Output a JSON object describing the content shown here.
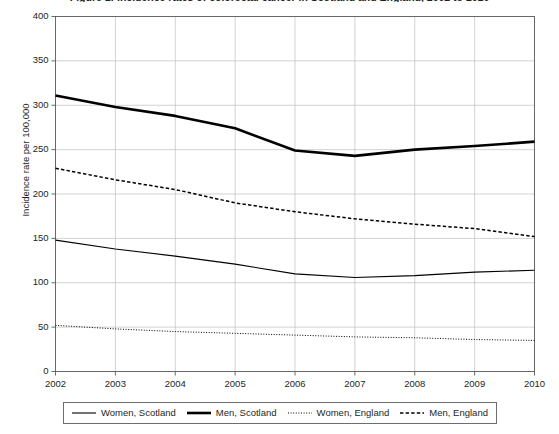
{
  "chart_data": {
    "type": "line",
    "title": "Figure 1: Incidence rates of colorectal cancer in Scotland and England, 2002 to 2010",
    "xlabel": "",
    "ylabel": "Incidence rate per 100,000",
    "x": [
      2002,
      2003,
      2004,
      2005,
      2006,
      2007,
      2008,
      2009,
      2010
    ],
    "xtick_labels": [
      "2002",
      "2003",
      "2004",
      "2005",
      "2006",
      "2007",
      "2008",
      "2009",
      "2010"
    ],
    "xlim": [
      2002,
      2010
    ],
    "ylim": [
      0,
      400
    ],
    "yticks": [
      0,
      50,
      100,
      150,
      200,
      250,
      300,
      350,
      400
    ],
    "ytick_labels": [
      "0",
      "50",
      "100",
      "150",
      "200",
      "250",
      "300",
      "350",
      "400"
    ],
    "grid": "both",
    "legend_position": "bottom",
    "series": [
      {
        "name": "Women, Scotland",
        "style": "solid-thin",
        "color": "#000000",
        "values": [
          148,
          138,
          130,
          121,
          110,
          106,
          108,
          112,
          114
        ]
      },
      {
        "name": "Men, Scotland",
        "style": "solid-thick",
        "color": "#000000",
        "values": [
          311,
          298,
          288,
          274,
          249,
          243,
          250,
          254,
          259
        ]
      },
      {
        "name": "Women, England",
        "style": "dotted",
        "color": "#000000",
        "values": [
          52,
          48,
          45,
          43,
          41,
          39,
          38,
          36,
          35
        ]
      },
      {
        "name": "Men, England",
        "style": "dashed",
        "color": "#000000",
        "values": [
          229,
          216,
          205,
          190,
          180,
          172,
          166,
          161,
          152
        ]
      }
    ]
  },
  "legend": {
    "items": [
      {
        "label": "Women, Scotland",
        "style": "solid-thin"
      },
      {
        "label": "Men, Scotland",
        "style": "solid-thick"
      },
      {
        "label": "Women, England",
        "style": "dotted"
      },
      {
        "label": "Men, England",
        "style": "dashed"
      }
    ]
  }
}
